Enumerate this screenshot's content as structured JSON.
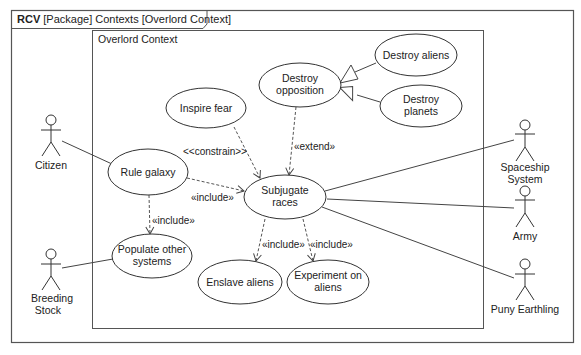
{
  "frame": {
    "title_bold": "RCV",
    "title_rest": " [Package] Contexts [Overlord Context]"
  },
  "context": {
    "title": "Overlord Context"
  },
  "use_cases": [
    {
      "id": "destroy-aliens",
      "lines": [
        "Destroy aliens"
      ]
    },
    {
      "id": "destroy-opposition",
      "lines": [
        "Destroy",
        "opposition"
      ]
    },
    {
      "id": "destroy-planets",
      "lines": [
        "Destroy",
        "planets"
      ]
    },
    {
      "id": "inspire-fear",
      "lines": [
        "Inspire fear"
      ]
    },
    {
      "id": "rule-galaxy",
      "lines": [
        "Rule galaxy"
      ]
    },
    {
      "id": "subjugate-races",
      "lines": [
        "Subjugate",
        "races"
      ]
    },
    {
      "id": "populate-other-systems",
      "lines": [
        "Populate other",
        "systems"
      ]
    },
    {
      "id": "enslave-aliens",
      "lines": [
        "Enslave aliens"
      ]
    },
    {
      "id": "experiment-on-aliens",
      "lines": [
        "Experiment on",
        "aliens"
      ]
    }
  ],
  "actors": [
    {
      "id": "citizen",
      "lines": [
        "Citizen"
      ]
    },
    {
      "id": "breeding-stock",
      "lines": [
        "Breeding",
        "Stock"
      ]
    },
    {
      "id": "spaceship-system",
      "lines": [
        "Spaceship",
        "System"
      ]
    },
    {
      "id": "army",
      "lines": [
        "Army"
      ]
    },
    {
      "id": "puny-earthling",
      "lines": [
        "Puny Earthling"
      ]
    }
  ],
  "relationships": {
    "constrain": "<<constrain>>",
    "extend": "«extend»",
    "include_rule_subjugate": "«include»",
    "include_rule_populate": "«include»",
    "include_subjugate_enslave": "«include»",
    "include_subjugate_experiment": "«include»"
  },
  "colors": {
    "line": "#444444",
    "frame": "#555555",
    "background": "#ffffff"
  }
}
